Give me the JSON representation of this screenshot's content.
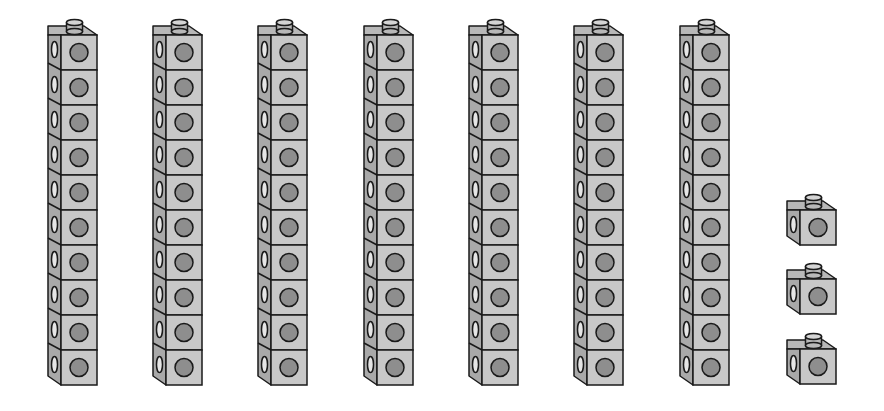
{
  "title": "Base-ten linking cubes",
  "colors": {
    "front": "#c8c8c8",
    "side": "#a9a9a9",
    "top": "#b8b8b8",
    "dot": "#8e8e8e",
    "stroke": "#1a1a1a"
  },
  "towers": {
    "count": 7,
    "cubes_per_tower": 10,
    "x_positions": [
      48,
      153,
      258,
      364,
      469,
      574,
      680
    ],
    "top_y": 18,
    "cube_height": 35
  },
  "single_cubes": {
    "count": 3,
    "x": 787,
    "stud_y": [
      193,
      262,
      332
    ]
  },
  "total_represented": 73
}
